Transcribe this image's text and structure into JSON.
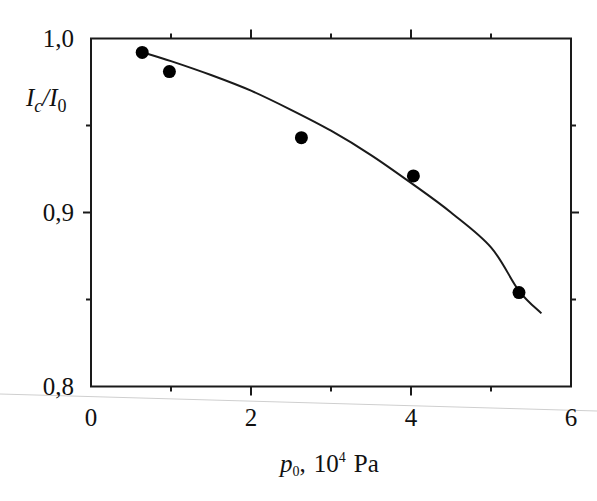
{
  "chart_data": {
    "type": "scatter",
    "title": "",
    "xlabel": "p0, 10^4 Pa",
    "xlabel_parts": {
      "var": "p",
      "sub": "0",
      "sep": ",",
      "base": "10",
      "exp": "4",
      "unit": "Pa"
    },
    "ylabel": "Ic/I0",
    "ylabel_parts": {
      "num": "I",
      "num_sub": "c",
      "den": "I",
      "den_sub": "0"
    },
    "xlim": [
      0,
      6
    ],
    "ylim": [
      0.8,
      1.0
    ],
    "x_ticks": [
      0,
      2,
      4,
      6
    ],
    "x_tick_labels": [
      "0",
      "2",
      "4",
      "6"
    ],
    "x_minor_ticks": [
      1,
      3,
      5
    ],
    "y_ticks": [
      0.8,
      0.9,
      1.0
    ],
    "y_tick_labels": [
      "0,8",
      "0,9",
      "1,0"
    ],
    "y_minor_ticks": [
      0.85,
      0.95
    ],
    "grid": false,
    "legend": null,
    "series": [
      {
        "name": "measured",
        "style": "markers",
        "marker": "filled-circle",
        "color": "#000000",
        "x": [
          0.64,
          0.98,
          2.63,
          4.03,
          5.35
        ],
        "y": [
          0.992,
          0.981,
          0.943,
          0.921,
          0.854
        ]
      },
      {
        "name": "fit",
        "style": "line",
        "color": "#1a1a1a",
        "x": [
          0.65,
          1.0,
          1.5,
          2.0,
          2.5,
          3.0,
          3.5,
          4.0,
          4.5,
          5.0,
          5.35,
          5.63
        ],
        "y": [
          0.992,
          0.987,
          0.979,
          0.97,
          0.959,
          0.947,
          0.933,
          0.917,
          0.9,
          0.88,
          0.855,
          0.842
        ]
      }
    ]
  },
  "colors": {
    "axis": "#1a1a1a",
    "marker": "#000000",
    "background": "#ffffff",
    "scan_line": "#c8c8c8"
  }
}
